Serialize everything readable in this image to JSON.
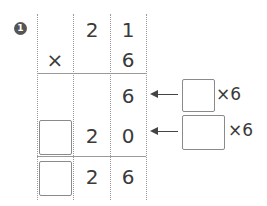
{
  "problem": {
    "number": "1",
    "multiplicand": {
      "tens": "2",
      "ones": "1"
    },
    "operator": "×",
    "multiplier": {
      "ones": "6"
    },
    "partial1": {
      "ones": "6"
    },
    "partial2": {
      "tens": "2",
      "ones": "0",
      "hundreds_blank": ""
    },
    "result": {
      "tens": "2",
      "ones": "6",
      "hundreds_blank": ""
    },
    "hints": [
      {
        "blank": "",
        "label": "×6"
      },
      {
        "blank": "",
        "label": "×6"
      }
    ]
  }
}
